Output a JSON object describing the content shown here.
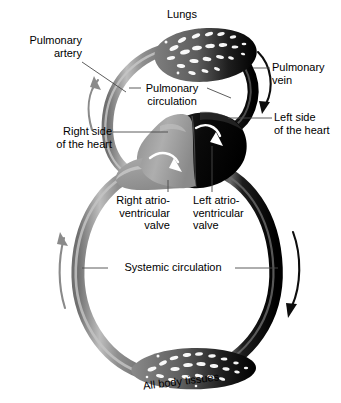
{
  "diagram": {
    "type": "anatomical-schematic"
  },
  "colors": {
    "deoxygenated": "#8a8a8a",
    "deoxygenated_highlight": "#b4b4b4",
    "deoxygenated_shadow": "#6e6e6e",
    "oxygenated": "#0d0d0d",
    "oxygenated_highlight": "#5a5a5a",
    "background": "#ffffff",
    "text": "#000000",
    "leader_line": "#4a4a4a",
    "valve_arrow": "#ffffff"
  },
  "labels": {
    "lungs": "Lungs",
    "pulmonary_artery": "Pulmonary\nartery",
    "pulmonary_vein": "Pulmonary\nvein",
    "pulmonary_circulation": "Pulmonary\ncirculation",
    "right_side_heart": "Right side\nof the heart",
    "left_side_heart": "Left side\nof the heart",
    "right_av_valve": "Right atrio-\nventricular\nvalve",
    "left_av_valve": "Left atrio-\nventricular\nvalve",
    "systemic_circulation": "Systemic circulation",
    "all_body_tissues": "All body tissues"
  },
  "flow_arrows": [
    {
      "name": "pulmonary-artery-flow",
      "color": "#8a8a8a",
      "direction": "up"
    },
    {
      "name": "pulmonary-vein-flow",
      "color": "#0d0d0d",
      "direction": "down"
    },
    {
      "name": "systemic-venous-return-flow",
      "color": "#8a8a8a",
      "direction": "up"
    },
    {
      "name": "systemic-arterial-flow",
      "color": "#0d0d0d",
      "direction": "down"
    },
    {
      "name": "right-av-valve-flow",
      "color": "#ffffff",
      "direction": "down"
    },
    {
      "name": "left-av-valve-flow",
      "color": "#ffffff",
      "direction": "down"
    }
  ]
}
